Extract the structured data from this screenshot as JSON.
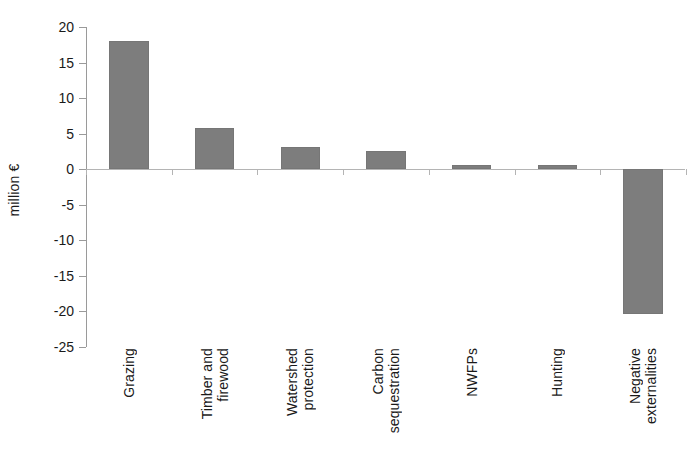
{
  "chart_data": {
    "type": "bar",
    "title": "",
    "subtitle": "",
    "xlabel": "",
    "ylabel": "million €",
    "categories": [
      "Grazing",
      "Timber and firewood",
      "Watershed protection",
      "Carbon sequestration",
      "NWFPs",
      "Hunting",
      "Negative externalities"
    ],
    "category_lines": [
      [
        "Grazing"
      ],
      [
        "Timber and",
        "firewood"
      ],
      [
        "Watershed",
        "protection"
      ],
      [
        "Carbon",
        "sequestration"
      ],
      [
        "NWFPs"
      ],
      [
        "Hunting"
      ],
      [
        "Negative",
        "externalities"
      ]
    ],
    "values": [
      18.0,
      5.8,
      3.1,
      2.6,
      0.6,
      0.55,
      -20.3
    ],
    "ylim": [
      -25,
      20
    ],
    "ytick_values": [
      20,
      15,
      10,
      5,
      0,
      -5,
      -10,
      -15,
      -20,
      -25
    ],
    "ytick_labels": [
      "20",
      "15",
      "10",
      "5",
      "0",
      "-5",
      "-10",
      "-15",
      "-20",
      "-25"
    ],
    "grid": false,
    "legend": false,
    "legend_position": "none",
    "bar_color": "#7d7d7d",
    "axis_color": "#9a9a9a",
    "baseline_color": "#b4b4b4",
    "background_color": "#ffffff"
  }
}
